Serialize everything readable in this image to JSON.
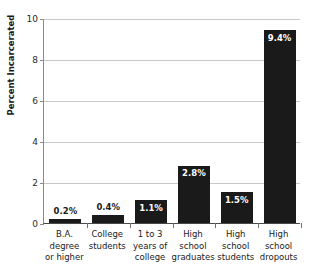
{
  "chart_data": {
    "type": "bar",
    "title": "",
    "xlabel": "",
    "ylabel": "Percent Incarcerated",
    "ylim": [
      0,
      10
    ],
    "yticks": [
      0,
      2,
      4,
      6,
      8,
      10
    ],
    "ytick_labels": [
      "0",
      "2",
      "4",
      "6",
      "8",
      "10"
    ],
    "grid": "horizontal",
    "legend": "none",
    "bar_color": "#1a1a1a",
    "gridline_color": "#c9c9c9",
    "categories": [
      "B.A. degree or higher",
      "College students",
      "1 to 3 years of college",
      "High school graduates",
      "High school students",
      "High school dropouts"
    ],
    "category_lines": [
      [
        "B.A.",
        "degree",
        "or higher"
      ],
      [
        "College",
        "students"
      ],
      [
        "1 to 3",
        "years of",
        "college"
      ],
      [
        "High",
        "school",
        "graduates"
      ],
      [
        "High",
        "school",
        "students"
      ],
      [
        "High",
        "school",
        "dropouts"
      ]
    ],
    "values": [
      0.2,
      0.4,
      1.1,
      2.8,
      1.5,
      9.4
    ],
    "data_labels": [
      "0.2%",
      "0.4%",
      "1.1%",
      "2.8%",
      "1.5%",
      "9.4%"
    ],
    "data_label_placement": [
      "outside",
      "outside",
      "inside",
      "inside",
      "inside",
      "inside"
    ]
  }
}
